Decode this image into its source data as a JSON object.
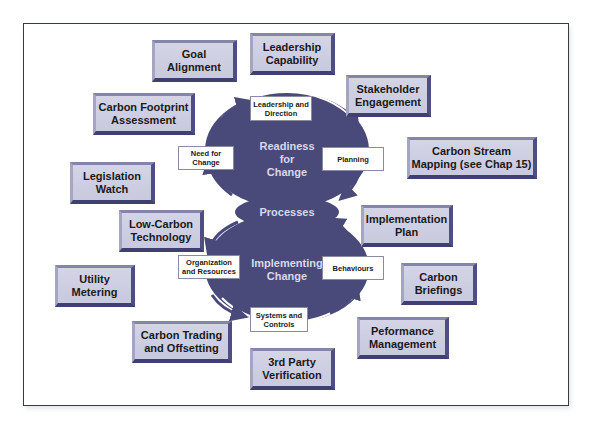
{
  "diagram": {
    "core": {
      "top_circle_label": "Readiness\nfor\nChange",
      "middle_label": "Processes",
      "bottom_circle_label": "Implementing\nChange",
      "fill_color": "#4a4a7a"
    },
    "cycle_labels": {
      "leadership_direction": "Leadership and Direction",
      "planning": "Planning",
      "need_for_change": "Need for Change",
      "organization_resources": "Organization and Resources",
      "behaviours": "Behaviours",
      "systems_controls": "Systems and Controls"
    },
    "boxes": [
      {
        "id": "goal-alignment",
        "label": "Goal Alignment"
      },
      {
        "id": "leadership-capability",
        "label": "Leadership Capability"
      },
      {
        "id": "carbon-footprint-assessment",
        "label": "Carbon Footprint Assessment"
      },
      {
        "id": "stakeholder-engagement",
        "label": "Stakeholder Engagement"
      },
      {
        "id": "carbon-stream-mapping",
        "label": "Carbon Stream Mapping (see Chap 15)"
      },
      {
        "id": "legislation-watch",
        "label": "Legislation Watch"
      },
      {
        "id": "low-carbon-technology",
        "label": "Low-Carbon Technology"
      },
      {
        "id": "implementation-plan",
        "label": "Implementation Plan"
      },
      {
        "id": "utility-metering",
        "label": "Utility Metering"
      },
      {
        "id": "carbon-briefings",
        "label": "Carbon Briefings"
      },
      {
        "id": "peformance-management",
        "label": "Peformance Management"
      },
      {
        "id": "carbon-trading-offsetting",
        "label": "Carbon Trading and Offsetting"
      },
      {
        "id": "third-party-verification",
        "label": "3rd Party Verification"
      }
    ],
    "colors": {
      "box_fill": "#cdcde2",
      "box_dark_edge": "#45457a",
      "core_fill": "#4a4a7a",
      "frame_border": "#3a3a3a"
    }
  }
}
